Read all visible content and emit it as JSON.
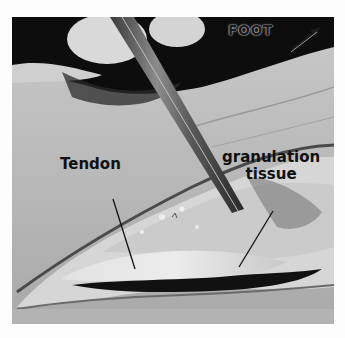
{
  "figure": {
    "labels": {
      "foot": "FOOT",
      "tendon": "Tendon",
      "granulation_line1": "granulation",
      "granulation_line2": "tissue"
    },
    "direction_arrow": "arrow-up-right-icon"
  }
}
